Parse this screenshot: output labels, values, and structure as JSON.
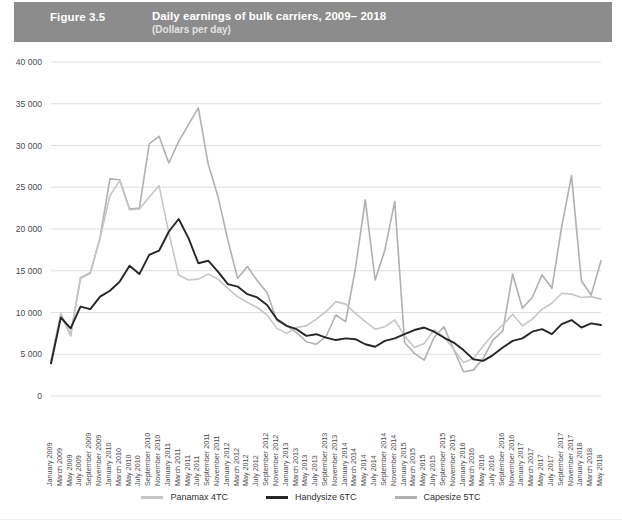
{
  "header": {
    "figure_number": "Figure 3.5",
    "title": "Daily earnings of bulk carriers, 2009– 2018",
    "subtitle": "(Dollars per day)",
    "band_color": "#8c8c8c"
  },
  "legend": {
    "items": [
      {
        "label": "Panamax  4TC",
        "color": "#c6c6c6"
      },
      {
        "label": "Handysize 6TC",
        "color": "#262626"
      },
      {
        "label": "Capesize 5TC",
        "color": "#b0b0b0"
      }
    ]
  },
  "chart_data": {
    "type": "line",
    "title": "Daily earnings of bulk carriers, 2009– 2018",
    "subtitle": "(Dollars per day)",
    "xlabel": "",
    "ylabel": "",
    "ylim": [
      0,
      40000
    ],
    "yticks": [
      0,
      5000,
      10000,
      15000,
      20000,
      25000,
      30000,
      35000,
      40000
    ],
    "ytick_labels": [
      "0",
      "5 000",
      "10 000",
      "15 000",
      "20 000",
      "25 000",
      "30 000",
      "35 000",
      "40 000"
    ],
    "grid": true,
    "legend_position": "bottom",
    "x_tick_interval_months": 2,
    "categories": [
      "January 2009",
      "March 2009",
      "May 2009",
      "July 2009",
      "September 2009",
      "November 2009",
      "January 2010",
      "March 2010",
      "May 2010",
      "July 2010",
      "September 2010",
      "November 2010",
      "January 2011",
      "March 2011",
      "May 2011",
      "July 2011",
      "September 2011",
      "November 2011",
      "January 2012",
      "March 2012",
      "May 2012",
      "July 2012",
      "September 2012",
      "November 2012",
      "January 2013",
      "March 2013",
      "May 2013",
      "July 2013",
      "September 2013",
      "November 2013",
      "January 2014",
      "March 2014",
      "May 2014",
      "July 2014",
      "September 2014",
      "November 2014",
      "January 2015",
      "March 2015",
      "May 2015",
      "July 2015",
      "September 2015",
      "November 2015",
      "January 2016",
      "March 2016",
      "May 2016",
      "July 2016",
      "September 2016",
      "November 2016",
      "January 2017",
      "March 2017",
      "May 2017",
      "July 2017",
      "September 2017",
      "November 2017",
      "January 2018",
      "March 2018",
      "May 2018"
    ],
    "series": [
      {
        "name": "Panamax  4TC",
        "color": "#c6c6c6",
        "values": [
          4200,
          9900,
          7300,
          14200,
          14800,
          18900,
          24000,
          25800,
          22300,
          22400,
          23800,
          25200,
          19500,
          14500,
          13900,
          14000,
          14600,
          14000,
          12900,
          11900,
          11200,
          10600,
          9700,
          8100,
          7500,
          8200,
          8400,
          9200,
          10100,
          11300,
          11000,
          9900,
          8900,
          8000,
          8300,
          9100,
          7200,
          5800,
          6300,
          7900,
          7100,
          5600,
          4000,
          4500,
          6000,
          7400,
          8500,
          9800,
          8400,
          9200,
          10400,
          11100,
          12300,
          12200,
          11800,
          11900,
          11600
        ]
      },
      {
        "name": "Handysize 6TC",
        "color": "#262626",
        "values": [
          3900,
          9400,
          8100,
          10700,
          10400,
          11900,
          12600,
          13700,
          15600,
          14600,
          16900,
          17400,
          19700,
          21200,
          18900,
          15900,
          16200,
          14900,
          13400,
          13100,
          12200,
          11800,
          10900,
          9200,
          8400,
          8000,
          7200,
          7400,
          7000,
          6700,
          6900,
          6800,
          6200,
          5900,
          6600,
          6900,
          7400,
          7900,
          8200,
          7700,
          7000,
          6400,
          5500,
          4400,
          4200,
          4900,
          5800,
          6600,
          6900,
          7700,
          8000,
          7400,
          8600,
          9100,
          8200,
          8700,
          8500
        ]
      },
      {
        "name": "Capesize 5TC",
        "color": "#b0b0b0",
        "values": [
          4100,
          9800,
          7200,
          14100,
          14700,
          19000,
          26000,
          25900,
          22400,
          22500,
          30200,
          31100,
          27900,
          30500,
          32500,
          34500,
          27800,
          23900,
          18700,
          14100,
          15500,
          13800,
          12400,
          9000,
          8400,
          7600,
          6500,
          6200,
          7100,
          9700,
          8900,
          15300,
          23500,
          13900,
          17500,
          23300,
          6400,
          5100,
          4300,
          7000,
          8300,
          5600,
          2900,
          3100,
          4500,
          6700,
          7800,
          14600,
          10500,
          11800,
          14500,
          12900,
          20300,
          26400,
          13800,
          12100,
          16200
        ]
      }
    ]
  }
}
